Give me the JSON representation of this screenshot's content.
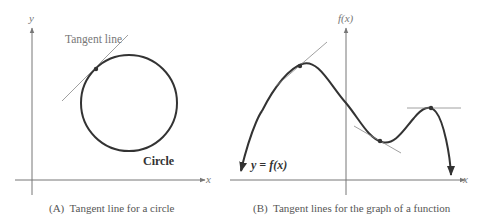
{
  "panel_a": {
    "y_axis_label": "y",
    "x_axis_label": "x",
    "tangent_label": "Tangent line",
    "circle_label": "Circle",
    "caption": "(A)  Tangent line for a circle"
  },
  "panel_b": {
    "y_axis_label": "f(x)",
    "x_axis_label": "x",
    "curve_label": "y = f(x)",
    "caption": "(B)  Tangent lines for the graph of a function"
  },
  "colors": {
    "axis": "#777777",
    "curve": "#333333",
    "tangent": "#888888",
    "text": "#555555"
  }
}
